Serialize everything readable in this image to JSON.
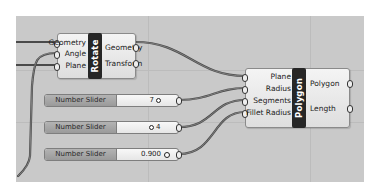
{
  "canvas": {
    "background": "#c9c9c9"
  },
  "rotate": {
    "title": "Rotate",
    "inputs": [
      "Geometry",
      "Angle",
      "Plane"
    ],
    "outputs": [
      "Geometry",
      "Transform"
    ]
  },
  "polygon": {
    "title": "Polygon",
    "inputs": [
      "Plane",
      "Radius",
      "Segments",
      "Fillet Radius"
    ],
    "outputs": [
      "Polygon",
      "Length"
    ]
  },
  "sliders": [
    {
      "label": "Number Slider",
      "value": "7"
    },
    {
      "label": "Number Slider",
      "value": "4"
    },
    {
      "label": "Number Slider",
      "value": "0.900"
    }
  ]
}
